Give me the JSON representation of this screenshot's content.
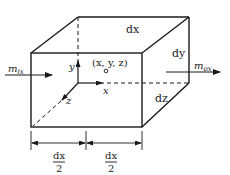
{
  "diagram": {
    "type": "control-volume-cube",
    "labels": {
      "dx_top": "dx",
      "dy_side": "dy",
      "dz_side": "dz",
      "point": "(x, y, z)",
      "axis_x": "x",
      "axis_y": "y",
      "axis_z": "z",
      "m_in_base": "m",
      "m_in_sub": "ix",
      "m_out_base": "m",
      "m_out_sub": "ox",
      "half_dx_num_left": "dx",
      "half_dx_den_left": "2",
      "half_dx_num_right": "dx",
      "half_dx_den_right": "2"
    },
    "colors": {
      "stroke": "#1a1a1a",
      "background": "#ffffff"
    }
  }
}
